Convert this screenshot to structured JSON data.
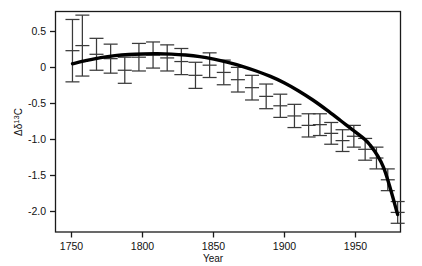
{
  "chart_data": {
    "type": "line",
    "title": "",
    "xlabel": "Year",
    "ylabel": "Δδ¹³C",
    "ylabel_parts": {
      "delta_cap": "Δ",
      "delta_low": "δ",
      "superscript": "13",
      "element": "C"
    },
    "xlim": [
      1738,
      1982
    ],
    "ylim": [
      -2.32,
      0.72
    ],
    "xticks": [
      1750,
      1800,
      1850,
      1900,
      1950
    ],
    "xtick_labels": [
      "1750",
      "1800",
      "1850",
      "1900",
      "1950"
    ],
    "yticks": [
      0.5,
      0,
      -0.5,
      -1.0,
      -1.5,
      -2.0
    ],
    "ytick_labels": [
      "0.5",
      "0",
      "-0.5",
      "-1.0",
      "-1.5",
      "-2.0"
    ],
    "grid": false,
    "legend": "none",
    "series": [
      {
        "name": "measurements",
        "marker": "errorbar",
        "x": [
          1750,
          1757,
          1767,
          1777,
          1787,
          1797,
          1807,
          1817,
          1827,
          1837,
          1847,
          1857,
          1867,
          1877,
          1887,
          1897,
          1907,
          1917,
          1925,
          1933,
          1941,
          1949,
          1957,
          1965,
          1973,
          1980
        ],
        "y": [
          0.18,
          0.25,
          0.13,
          0.07,
          -0.09,
          0.09,
          0.12,
          0.08,
          0.03,
          -0.16,
          -0.02,
          -0.12,
          -0.22,
          -0.33,
          -0.45,
          -0.58,
          -0.72,
          -0.85,
          -0.84,
          -0.96,
          -1.06,
          -1.0,
          -1.18,
          -1.3,
          -1.6,
          -2.05
        ],
        "yerr": [
          0.43,
          0.42,
          0.22,
          0.2,
          0.18,
          0.19,
          0.18,
          0.18,
          0.18,
          0.18,
          0.17,
          0.17,
          0.17,
          0.17,
          0.17,
          0.16,
          0.16,
          0.16,
          0.15,
          0.15,
          0.15,
          0.15,
          0.15,
          0.15,
          0.15,
          0.15
        ]
      },
      {
        "name": "smoothed-fit",
        "marker": "line",
        "x": [
          1750,
          1760,
          1770,
          1780,
          1790,
          1800,
          1810,
          1820,
          1830,
          1840,
          1850,
          1860,
          1870,
          1880,
          1890,
          1900,
          1910,
          1920,
          1930,
          1940,
          1950,
          1960,
          1970,
          1980
        ],
        "y": [
          0.0,
          0.045,
          0.085,
          0.112,
          0.128,
          0.135,
          0.137,
          0.133,
          0.12,
          0.098,
          0.063,
          0.018,
          -0.035,
          -0.1,
          -0.175,
          -0.265,
          -0.375,
          -0.5,
          -0.64,
          -0.79,
          -0.94,
          -1.11,
          -1.43,
          -2.08
        ]
      }
    ]
  }
}
